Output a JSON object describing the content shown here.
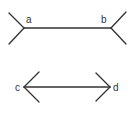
{
  "figure": {
    "type": "muller-lyer-illusion",
    "colors": {
      "line": "#333333",
      "background": "#ffffff"
    },
    "top_figure": {
      "description": "line with outward-pointing (tail) fins",
      "left_label": "a",
      "right_label": "b"
    },
    "bottom_figure": {
      "description": "line with inward arrowheads (double-headed arrow)",
      "left_label": "c",
      "right_label": "d"
    }
  }
}
